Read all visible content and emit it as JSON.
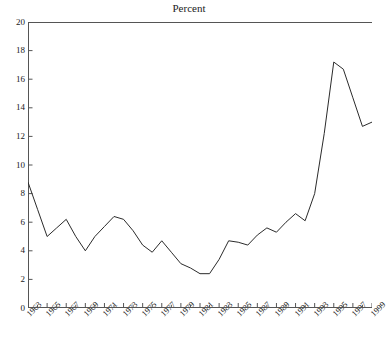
{
  "chart_data": {
    "type": "line",
    "title": "Percent",
    "supertitle": "",
    "xlabel": "",
    "ylabel": "",
    "xlim": [
      1963,
      1999
    ],
    "ylim": [
      0,
      20
    ],
    "ytick_step": 2,
    "xtick_step": 2,
    "grid": false,
    "legend": "none",
    "line_color": "#2b2b2b",
    "axis_color": "#555555",
    "categories": [
      1963,
      1964,
      1965,
      1966,
      1967,
      1968,
      1969,
      1970,
      1971,
      1972,
      1973,
      1974,
      1975,
      1976,
      1977,
      1978,
      1979,
      1980,
      1981,
      1982,
      1983,
      1984,
      1985,
      1986,
      1987,
      1988,
      1989,
      1990,
      1991,
      1992,
      1993,
      1994,
      1995,
      1996,
      1997,
      1998,
      1999
    ],
    "values": [
      8.8,
      6.9,
      5.0,
      5.6,
      6.2,
      5.0,
      4.0,
      5.0,
      5.7,
      6.4,
      6.2,
      5.4,
      4.4,
      3.9,
      4.7,
      3.9,
      3.1,
      2.8,
      2.4,
      2.4,
      3.4,
      4.7,
      4.6,
      4.4,
      5.1,
      5.6,
      5.3,
      6.0,
      6.6,
      6.1,
      8.0,
      12.2,
      17.2,
      16.7,
      14.7,
      12.7,
      13.0
    ],
    "ytick_labels": [
      "0",
      "2",
      "4",
      "6",
      "8",
      "10",
      "12",
      "14",
      "16",
      "18",
      "20"
    ],
    "ytick_values": [
      0,
      2,
      4,
      6,
      8,
      10,
      12,
      14,
      16,
      18,
      20
    ],
    "xtick_labels": [
      "1963",
      "1965",
      "1967",
      "1969",
      "1971",
      "1973",
      "1975",
      "1977",
      "1979",
      "1981",
      "1983",
      "1985",
      "1987",
      "1989",
      "1991",
      "1993",
      "1995",
      "1997",
      "1999"
    ],
    "xtick_values": [
      1963,
      1965,
      1967,
      1969,
      1971,
      1973,
      1975,
      1977,
      1979,
      1981,
      1983,
      1985,
      1987,
      1989,
      1991,
      1993,
      1995,
      1997,
      1999
    ]
  }
}
